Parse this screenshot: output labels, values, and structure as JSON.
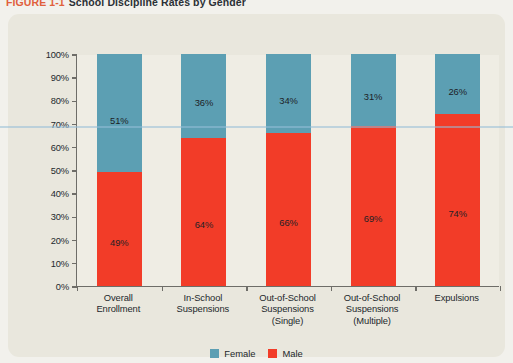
{
  "caption": {
    "figure_number": "FIGURE 1-1",
    "title": "School Discipline Rates by Gender"
  },
  "colors": {
    "female": "#5c9fb3",
    "male": "#f23c28",
    "panel": "#e9e7dd",
    "plot_bg": "#efede4",
    "axis": "#6e6d68",
    "caption_number": "#e0603c",
    "caption_title": "#2b3036"
  },
  "legend": {
    "position": "bottom-center",
    "items": [
      {
        "label": "Female",
        "color": "#5c9fb3"
      },
      {
        "label": "Male",
        "color": "#f23c28"
      }
    ]
  },
  "chart_data": {
    "type": "bar",
    "stacked": true,
    "title": "School Discipline Rates by Gender",
    "xlabel": "",
    "ylabel": "",
    "ylim": [
      0,
      100
    ],
    "grid": false,
    "yticks": [
      "0%",
      "10%",
      "20%",
      "30%",
      "40%",
      "50%",
      "60%",
      "70%",
      "80%",
      "90%",
      "100%"
    ],
    "ytick_values": [
      0,
      10,
      20,
      30,
      40,
      50,
      60,
      70,
      80,
      90,
      100
    ],
    "categories": [
      "Overall Enrollment",
      "In-School Suspensions",
      "Out-of-School Suspensions (Single)",
      "Out-of-School Suspensions (Multiple)",
      "Expulsions"
    ],
    "category_lines": [
      [
        "Overall",
        "Enrollment"
      ],
      [
        "In-School",
        "Suspensions"
      ],
      [
        "Out-of-School",
        "Suspensions",
        "(Single)"
      ],
      [
        "Out-of-School",
        "Suspensions",
        "(Multiple)"
      ],
      [
        "Expulsions"
      ]
    ],
    "series": [
      {
        "name": "Male",
        "color": "#f23c28",
        "values": [
          49,
          64,
          66,
          69,
          74
        ],
        "labels": [
          "49%",
          "64%",
          "66%",
          "69%",
          "74%"
        ]
      },
      {
        "name": "Female",
        "color": "#5c9fb3",
        "values": [
          51,
          36,
          34,
          31,
          26
        ],
        "labels": [
          "51%",
          "36%",
          "34%",
          "31%",
          "26%"
        ]
      }
    ]
  }
}
